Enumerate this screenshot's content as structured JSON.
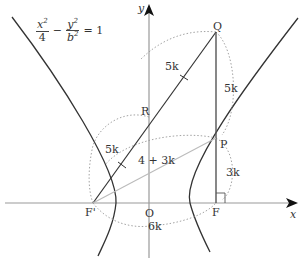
{
  "diagram": {
    "title_equation": {
      "term1_num": "x",
      "term1_den": "4",
      "minus": "−",
      "term2_num": "y",
      "term2_den": "b",
      "exp": "2",
      "equals": "= 1"
    },
    "axes": {
      "x_label": "x",
      "y_label": "y"
    },
    "points": {
      "O": "O",
      "F": "F",
      "F_prime": "F'",
      "P": "P",
      "Q": "Q",
      "R": "R"
    },
    "segment_labels": {
      "QR": "5k",
      "RF_prime": "5k",
      "QP": "5k",
      "PF": "3k",
      "PF_prime": "4 + 3k",
      "F_primeF": "6k"
    },
    "colors": {
      "curve": "#333333",
      "axis": "#999999",
      "segment": "#333333",
      "light_segment": "#bbbbbb",
      "dotted_arc": "#999999"
    }
  }
}
